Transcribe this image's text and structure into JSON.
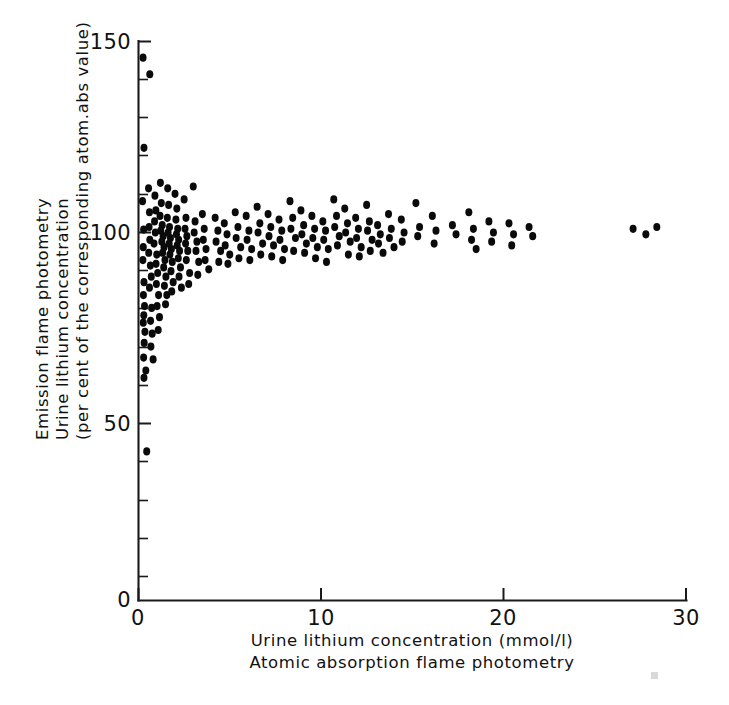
{
  "figure": {
    "name": "urine-lithium-method-comparison",
    "background_color": "#ffffff",
    "ink_color": "#111111",
    "point_color": "#0a0a0a"
  },
  "y_axis": {
    "title_line1": "Emission flame photometry",
    "title_line2": "Urine lithium concentration",
    "title_line3": "(per cent of the corresponding atom.abs value)",
    "tick_labels": [
      "150",
      "100",
      "50",
      "0"
    ],
    "tick_values": [
      150,
      100,
      50,
      0
    ],
    "minor_tick_step": 10,
    "min": 0,
    "max": 152
  },
  "x_axis": {
    "title_line1": "Urine lithium concentration (mmol/l)",
    "title_line2": "Atomic absorption flame photometry",
    "tick_labels": [
      "0",
      "10",
      "20",
      "30"
    ],
    "tick_values": [
      0,
      10,
      20,
      30
    ],
    "min": 0,
    "max": 30
  },
  "chart_data": {
    "type": "scatter",
    "title": "",
    "xlabel": "Urine lithium concentration (mmol/l) — Atomic absorption flame photometry",
    "ylabel": "Emission flame photometry — Urine lithium concentration (per cent of the corresponding atom.abs value)",
    "xlim": [
      0,
      30
    ],
    "ylim": [
      0,
      152
    ],
    "xticks": [
      0,
      10,
      20,
      30
    ],
    "yticks": [
      0,
      50,
      100,
      150
    ],
    "y_minor_tick_step": 10,
    "grid": false,
    "legend": null,
    "marker": "filled-circle",
    "reference_level": 100,
    "points": [
      [
        0.25,
        147.5
      ],
      [
        0.62,
        143.0
      ],
      [
        0.3,
        123.0
      ],
      [
        0.22,
        108.5
      ],
      [
        0.28,
        100.8
      ],
      [
        0.26,
        96.0
      ],
      [
        0.24,
        92.5
      ],
      [
        0.3,
        86.5
      ],
      [
        0.27,
        83.0
      ],
      [
        0.33,
        80.0
      ],
      [
        0.29,
        77.5
      ],
      [
        0.26,
        75.5
      ],
      [
        0.35,
        73.0
      ],
      [
        0.31,
        70.0
      ],
      [
        0.28,
        66.0
      ],
      [
        0.4,
        62.5
      ],
      [
        0.3,
        60.5
      ],
      [
        0.45,
        40.5
      ],
      [
        0.55,
        112.0
      ],
      [
        0.6,
        105.5
      ],
      [
        0.58,
        101.5
      ],
      [
        0.62,
        98.0
      ],
      [
        0.56,
        94.5
      ],
      [
        0.65,
        91.0
      ],
      [
        0.7,
        88.0
      ],
      [
        0.6,
        85.0
      ],
      [
        0.72,
        79.5
      ],
      [
        0.66,
        76.0
      ],
      [
        0.75,
        72.5
      ],
      [
        0.68,
        69.0
      ],
      [
        0.8,
        65.5
      ],
      [
        0.9,
        110.0
      ],
      [
        0.95,
        106.0
      ],
      [
        0.88,
        103.0
      ],
      [
        0.92,
        100.0
      ],
      [
        0.85,
        97.0
      ],
      [
        1.0,
        94.0
      ],
      [
        0.96,
        91.5
      ],
      [
        1.05,
        89.0
      ],
      [
        0.98,
        86.0
      ],
      [
        1.1,
        83.0
      ],
      [
        1.02,
        80.0
      ],
      [
        1.15,
        77.0
      ],
      [
        1.08,
        73.5
      ],
      [
        1.2,
        113.5
      ],
      [
        1.25,
        108.0
      ],
      [
        1.18,
        104.5
      ],
      [
        1.3,
        102.0
      ],
      [
        1.22,
        100.5
      ],
      [
        1.35,
        99.0
      ],
      [
        1.28,
        97.5
      ],
      [
        1.4,
        96.0
      ],
      [
        1.32,
        94.5
      ],
      [
        1.45,
        92.5
      ],
      [
        1.38,
        90.5
      ],
      [
        1.5,
        88.0
      ],
      [
        1.42,
        85.5
      ],
      [
        1.55,
        83.0
      ],
      [
        1.48,
        80.5
      ],
      [
        1.6,
        112.0
      ],
      [
        1.65,
        107.5
      ],
      [
        1.58,
        104.0
      ],
      [
        1.7,
        101.5
      ],
      [
        1.62,
        100.0
      ],
      [
        1.75,
        98.5
      ],
      [
        1.68,
        97.0
      ],
      [
        1.8,
        95.5
      ],
      [
        1.72,
        94.0
      ],
      [
        1.85,
        92.0
      ],
      [
        1.78,
        89.5
      ],
      [
        1.9,
        86.5
      ],
      [
        1.82,
        84.0
      ],
      [
        2.0,
        110.5
      ],
      [
        2.1,
        106.5
      ],
      [
        2.05,
        103.5
      ],
      [
        2.15,
        101.0
      ],
      [
        2.08,
        99.5
      ],
      [
        2.2,
        98.0
      ],
      [
        2.12,
        96.5
      ],
      [
        2.25,
        95.0
      ],
      [
        2.18,
        93.0
      ],
      [
        2.3,
        90.5
      ],
      [
        2.22,
        88.0
      ],
      [
        2.35,
        85.0
      ],
      [
        2.5,
        109.0
      ],
      [
        2.6,
        104.0
      ],
      [
        2.55,
        101.0
      ],
      [
        2.65,
        99.0
      ],
      [
        2.58,
        97.0
      ],
      [
        2.7,
        95.0
      ],
      [
        2.62,
        92.5
      ],
      [
        2.8,
        89.0
      ],
      [
        2.75,
        86.0
      ],
      [
        3.0,
        112.5
      ],
      [
        3.1,
        103.0
      ],
      [
        3.05,
        100.0
      ],
      [
        3.2,
        97.5
      ],
      [
        3.15,
        95.0
      ],
      [
        3.3,
        92.0
      ],
      [
        3.25,
        88.5
      ],
      [
        3.5,
        105.0
      ],
      [
        3.6,
        101.0
      ],
      [
        3.55,
        98.0
      ],
      [
        3.7,
        95.5
      ],
      [
        3.65,
        92.5
      ],
      [
        3.85,
        90.0
      ],
      [
        4.2,
        104.0
      ],
      [
        4.35,
        100.5
      ],
      [
        4.25,
        97.5
      ],
      [
        4.5,
        95.0
      ],
      [
        4.4,
        92.0
      ],
      [
        4.7,
        102.5
      ],
      [
        4.85,
        99.5
      ],
      [
        4.75,
        96.5
      ],
      [
        5.0,
        94.0
      ],
      [
        4.9,
        91.5
      ],
      [
        5.3,
        105.5
      ],
      [
        5.45,
        101.5
      ],
      [
        5.35,
        98.5
      ],
      [
        5.6,
        96.0
      ],
      [
        5.5,
        93.0
      ],
      [
        5.9,
        104.5
      ],
      [
        6.05,
        100.5
      ],
      [
        5.95,
        98.0
      ],
      [
        6.2,
        95.5
      ],
      [
        6.1,
        92.5
      ],
      [
        6.5,
        107.0
      ],
      [
        6.65,
        102.5
      ],
      [
        6.55,
        100.0
      ],
      [
        6.8,
        97.0
      ],
      [
        6.7,
        94.0
      ],
      [
        7.1,
        105.0
      ],
      [
        7.25,
        101.5
      ],
      [
        7.15,
        99.0
      ],
      [
        7.4,
        96.5
      ],
      [
        7.3,
        93.5
      ],
      [
        7.7,
        103.5
      ],
      [
        7.85,
        100.5
      ],
      [
        7.75,
        98.0
      ],
      [
        8.0,
        95.5
      ],
      [
        7.9,
        92.5
      ],
      [
        8.3,
        108.5
      ],
      [
        8.45,
        104.0
      ],
      [
        8.35,
        101.0
      ],
      [
        8.6,
        98.5
      ],
      [
        8.5,
        95.0
      ],
      [
        8.9,
        106.0
      ],
      [
        9.05,
        102.0
      ],
      [
        8.95,
        99.5
      ],
      [
        9.2,
        97.0
      ],
      [
        9.1,
        94.5
      ],
      [
        9.5,
        104.5
      ],
      [
        9.65,
        101.0
      ],
      [
        9.55,
        98.5
      ],
      [
        9.8,
        96.0
      ],
      [
        9.7,
        93.0
      ],
      [
        10.1,
        103.0
      ],
      [
        10.25,
        100.5
      ],
      [
        10.15,
        98.0
      ],
      [
        10.4,
        95.5
      ],
      [
        10.3,
        92.0
      ],
      [
        10.7,
        109.0
      ],
      [
        10.85,
        104.5
      ],
      [
        10.75,
        101.5
      ],
      [
        11.0,
        99.0
      ],
      [
        10.9,
        96.5
      ],
      [
        11.3,
        106.5
      ],
      [
        11.45,
        102.5
      ],
      [
        11.35,
        100.0
      ],
      [
        11.6,
        97.5
      ],
      [
        11.5,
        94.0
      ],
      [
        11.9,
        104.0
      ],
      [
        12.05,
        101.0
      ],
      [
        11.95,
        98.5
      ],
      [
        12.2,
        96.0
      ],
      [
        12.1,
        93.5
      ],
      [
        12.5,
        107.5
      ],
      [
        12.65,
        103.0
      ],
      [
        12.55,
        100.5
      ],
      [
        12.8,
        98.0
      ],
      [
        12.7,
        95.0
      ],
      [
        13.1,
        102.0
      ],
      [
        13.25,
        99.5
      ],
      [
        13.15,
        97.0
      ],
      [
        13.4,
        94.5
      ],
      [
        13.7,
        105.0
      ],
      [
        13.85,
        101.0
      ],
      [
        13.75,
        98.5
      ],
      [
        14.0,
        96.0
      ],
      [
        14.4,
        103.5
      ],
      [
        14.55,
        100.0
      ],
      [
        14.45,
        97.5
      ],
      [
        15.2,
        108.0
      ],
      [
        15.4,
        101.5
      ],
      [
        15.3,
        99.0
      ],
      [
        16.1,
        104.5
      ],
      [
        16.3,
        100.5
      ],
      [
        16.2,
        97.0
      ],
      [
        17.2,
        102.0
      ],
      [
        17.4,
        99.5
      ],
      [
        18.1,
        105.5
      ],
      [
        18.35,
        101.0
      ],
      [
        18.25,
        98.0
      ],
      [
        18.5,
        95.5
      ],
      [
        19.2,
        103.0
      ],
      [
        19.45,
        100.0
      ],
      [
        19.35,
        97.5
      ],
      [
        20.3,
        102.5
      ],
      [
        20.55,
        99.5
      ],
      [
        20.45,
        96.5
      ],
      [
        21.4,
        101.5
      ],
      [
        21.6,
        99.0
      ],
      [
        27.1,
        101.0
      ],
      [
        27.8,
        99.5
      ],
      [
        28.4,
        101.5
      ]
    ]
  }
}
